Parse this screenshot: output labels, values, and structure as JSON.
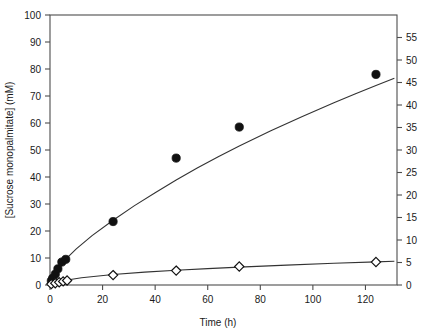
{
  "chart_data": {
    "type": "scatter",
    "title": "",
    "xlabel": "Time (h)",
    "ylabel": "[Sucrose monopalmitate] (mM)",
    "y2label": "",
    "xlim": [
      0,
      132
    ],
    "ylim": [
      0,
      100
    ],
    "y2lim": [
      0,
      60
    ],
    "xticks": [
      0,
      20,
      40,
      60,
      80,
      100,
      120
    ],
    "xticklabels": [
      "0",
      "20",
      "40",
      "60",
      "80",
      "100",
      "120"
    ],
    "yticks": [
      0,
      10,
      20,
      30,
      40,
      50,
      60,
      70,
      80,
      90,
      100
    ],
    "yticklabels": [
      "0",
      "10",
      "20",
      "30",
      "40",
      "50",
      "60",
      "70",
      "80",
      "90",
      "100"
    ],
    "y2ticks": [
      0,
      5,
      10,
      15,
      20,
      25,
      30,
      35,
      40,
      45,
      50,
      55
    ],
    "y2ticklabels": [
      "0",
      "5",
      "10",
      "15",
      "20",
      "25",
      "30",
      "35",
      "40",
      "45",
      "50",
      "55"
    ],
    "grid": false,
    "legend": "none",
    "series": [
      {
        "name": "filled-circles",
        "marker": "filled-circle",
        "axis": "left",
        "points": [
          {
            "x": 0.5,
            "y": 1.5
          },
          {
            "x": 1.0,
            "y": 2.5
          },
          {
            "x": 2.0,
            "y": 4.0
          },
          {
            "x": 3.0,
            "y": 6.0
          },
          {
            "x": 4.5,
            "y": 8.5
          },
          {
            "x": 6.0,
            "y": 9.5
          },
          {
            "x": 24.0,
            "y": 23.5
          },
          {
            "x": 48.0,
            "y": 47.0
          },
          {
            "x": 72.0,
            "y": 58.5
          },
          {
            "x": 124.0,
            "y": 78.0
          }
        ]
      },
      {
        "name": "open-diamonds",
        "marker": "open-diamond",
        "axis": "right",
        "points": [
          {
            "x": 0.5,
            "y": 0.2
          },
          {
            "x": 2.0,
            "y": 0.4
          },
          {
            "x": 3.5,
            "y": 0.6
          },
          {
            "x": 5.0,
            "y": 0.8
          },
          {
            "x": 6.5,
            "y": 1.0
          },
          {
            "x": 24.0,
            "y": 2.2
          },
          {
            "x": 48.0,
            "y": 3.2
          },
          {
            "x": 72.0,
            "y": 4.1
          },
          {
            "x": 124.0,
            "y": 5.1
          }
        ]
      }
    ],
    "fit_curves": [
      {
        "name": "upper-fit",
        "axis": "left",
        "model": "saturating",
        "points": [
          {
            "x": 0,
            "y": 0
          },
          {
            "x": 1,
            "y": 2.8
          },
          {
            "x": 2,
            "y": 4.6
          },
          {
            "x": 4,
            "y": 7.4
          },
          {
            "x": 6,
            "y": 9.6
          },
          {
            "x": 10,
            "y": 13.4
          },
          {
            "x": 16,
            "y": 18.3
          },
          {
            "x": 24,
            "y": 24.0
          },
          {
            "x": 32,
            "y": 29.3
          },
          {
            "x": 40,
            "y": 34.2
          },
          {
            "x": 48,
            "y": 38.9
          },
          {
            "x": 56,
            "y": 43.3
          },
          {
            "x": 64,
            "y": 47.5
          },
          {
            "x": 72,
            "y": 51.5
          },
          {
            "x": 84,
            "y": 57.1
          },
          {
            "x": 96,
            "y": 62.4
          },
          {
            "x": 108,
            "y": 67.5
          },
          {
            "x": 116,
            "y": 70.7
          },
          {
            "x": 124,
            "y": 73.9
          },
          {
            "x": 131,
            "y": 76.6
          }
        ]
      },
      {
        "name": "lower-fit",
        "axis": "right",
        "model": "saturating",
        "points": [
          {
            "x": 0,
            "y": 0
          },
          {
            "x": 2,
            "y": 0.45
          },
          {
            "x": 6,
            "y": 1.05
          },
          {
            "x": 12,
            "y": 1.62
          },
          {
            "x": 24,
            "y": 2.35
          },
          {
            "x": 36,
            "y": 2.86
          },
          {
            "x": 48,
            "y": 3.28
          },
          {
            "x": 60,
            "y": 3.64
          },
          {
            "x": 72,
            "y": 3.98
          },
          {
            "x": 90,
            "y": 4.42
          },
          {
            "x": 108,
            "y": 4.82
          },
          {
            "x": 124,
            "y": 5.14
          },
          {
            "x": 131,
            "y": 5.28
          }
        ]
      }
    ]
  },
  "axes": {
    "x_title": "Time (h)",
    "y_left_title": "[Sucrose monopalmitate] (mM)",
    "y_right_title": ""
  },
  "colors": {
    "background": "#ffffff",
    "frame": "#4d4d4d",
    "curve": "#333333",
    "marker_filled": "#111111",
    "marker_open_fill": "#ffffff",
    "marker_open_stroke": "#111111",
    "text": "#1a1a1a"
  }
}
